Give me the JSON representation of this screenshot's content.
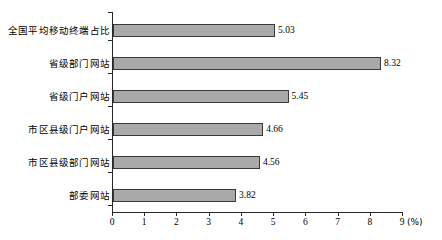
{
  "chart_data": {
    "type": "bar",
    "orientation": "horizontal",
    "title": "",
    "xlabel": "(%)",
    "ylabel": "",
    "xlim": [
      0,
      9
    ],
    "grid": false,
    "legend": null,
    "unit": "(%)",
    "xticks": [
      "0",
      "1",
      "2",
      "3",
      "4",
      "5",
      "6",
      "7",
      "8",
      "9"
    ],
    "categories": [
      "全国平均移动终端占比",
      "省级部门网站",
      "省级门户网站",
      "市区县级门户网站",
      "市区县级部门网站",
      "部委网站"
    ],
    "values": [
      5.03,
      8.32,
      5.45,
      4.66,
      4.56,
      3.82
    ],
    "value_labels": [
      "5.03",
      "8.32",
      "5.45",
      "4.66",
      "4.56",
      "3.82"
    ],
    "colors": {
      "bar_fill": "#a9a9a9",
      "bar_stroke": "#3a3a3a",
      "axis": "#262626",
      "text": "#000000",
      "background": "#ffffff"
    }
  }
}
